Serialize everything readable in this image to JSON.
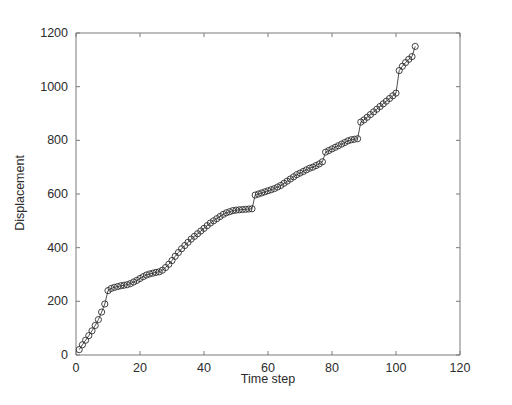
{
  "chart_data": {
    "type": "line",
    "title": "",
    "xlabel": "Time step",
    "ylabel": "Displacement",
    "xlim": [
      0,
      120
    ],
    "ylim": [
      0,
      1200
    ],
    "xticks": [
      0,
      20,
      40,
      60,
      80,
      100,
      120
    ],
    "yticks": [
      0,
      200,
      400,
      600,
      800,
      1000,
      1200
    ],
    "grid": false,
    "legend": null,
    "marker": "open-circle",
    "line_color": "#3a3a3a",
    "marker_color": "#2e2e2e",
    "axis_color": "#7a7a7a",
    "series": [
      {
        "name": "Displacement",
        "x": [
          1,
          2,
          3,
          4,
          5,
          6,
          7,
          8,
          9,
          10,
          11,
          12,
          13,
          14,
          15,
          16,
          17,
          18,
          19,
          20,
          21,
          22,
          23,
          24,
          25,
          26,
          27,
          28,
          29,
          30,
          31,
          32,
          33,
          34,
          35,
          36,
          37,
          38,
          39,
          40,
          41,
          42,
          43,
          44,
          45,
          46,
          47,
          48,
          49,
          50,
          51,
          52,
          53,
          54,
          55,
          56,
          57,
          58,
          59,
          60,
          61,
          62,
          63,
          64,
          65,
          66,
          67,
          68,
          69,
          70,
          71,
          72,
          73,
          74,
          75,
          76,
          77,
          78,
          79,
          80,
          81,
          82,
          83,
          84,
          85,
          86,
          87,
          88,
          89,
          90,
          91,
          92,
          93,
          94,
          95,
          96,
          97,
          98,
          99,
          100,
          101,
          102,
          103,
          104,
          105,
          106
        ],
        "values": [
          20,
          38,
          55,
          72,
          90,
          110,
          132,
          160,
          190,
          240,
          248,
          252,
          255,
          258,
          260,
          262,
          266,
          272,
          278,
          285,
          292,
          298,
          302,
          305,
          308,
          310,
          316,
          326,
          338,
          352,
          368,
          382,
          396,
          408,
          420,
          432,
          442,
          452,
          462,
          472,
          482,
          492,
          500,
          508,
          516,
          524,
          530,
          534,
          538,
          540,
          541,
          542,
          543,
          544,
          545,
          596,
          600,
          604,
          608,
          612,
          616,
          620,
          626,
          632,
          640,
          648,
          656,
          664,
          672,
          678,
          684,
          690,
          696,
          700,
          706,
          712,
          720,
          756,
          762,
          768,
          774,
          780,
          786,
          792,
          798,
          802,
          804,
          806,
          868,
          876,
          886,
          896,
          906,
          916,
          926,
          936,
          946,
          956,
          966,
          976,
          1060,
          1076,
          1090,
          1102,
          1112,
          1150
        ]
      }
    ]
  },
  "axis": {
    "ylabel": "Displacement",
    "xlabel": "Time step",
    "xtick_labels": [
      "0",
      "20",
      "40",
      "60",
      "80",
      "100",
      "120"
    ],
    "ytick_labels": [
      "0",
      "200",
      "400",
      "600",
      "800",
      "1000",
      "1200"
    ]
  }
}
